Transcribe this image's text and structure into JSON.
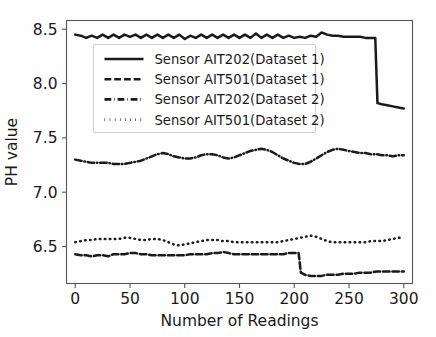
{
  "chart_data": {
    "type": "line",
    "title": "",
    "xlabel": "Number of Readings",
    "ylabel": "PH value",
    "xlim": [
      -8,
      308
    ],
    "ylim": [
      6.16,
      8.58
    ],
    "xticks": [
      0,
      50,
      100,
      150,
      200,
      250,
      300
    ],
    "xticklabels": [
      "0",
      "50",
      "100",
      "150",
      "200",
      "250",
      "300"
    ],
    "yticks": [
      6.5,
      7.0,
      7.5,
      8.0,
      8.5
    ],
    "yticklabels": [
      "6.5",
      "7.0",
      "7.5",
      "8.0",
      "8.5"
    ],
    "grid": false,
    "legend_position": "upper left",
    "line_color": "#1a1a1a",
    "series": [
      {
        "name": "Sensor AIT202(Dataset 1)",
        "style": "solid",
        "x": [
          0,
          5,
          10,
          15,
          20,
          25,
          30,
          35,
          40,
          45,
          50,
          55,
          60,
          65,
          70,
          75,
          80,
          85,
          90,
          95,
          100,
          105,
          110,
          115,
          120,
          125,
          130,
          135,
          140,
          145,
          150,
          155,
          160,
          165,
          170,
          175,
          180,
          185,
          190,
          195,
          200,
          205,
          210,
          215,
          220,
          225,
          230,
          235,
          240,
          245,
          250,
          255,
          260,
          265,
          270,
          274,
          276,
          280,
          285,
          290,
          295,
          300
        ],
        "y": [
          8.45,
          8.44,
          8.42,
          8.44,
          8.42,
          8.45,
          8.42,
          8.45,
          8.42,
          8.45,
          8.43,
          8.45,
          8.42,
          8.45,
          8.42,
          8.45,
          8.42,
          8.45,
          8.42,
          8.45,
          8.41,
          8.44,
          8.42,
          8.45,
          8.42,
          8.45,
          8.42,
          8.45,
          8.42,
          8.45,
          8.42,
          8.45,
          8.42,
          8.46,
          8.42,
          8.45,
          8.42,
          8.45,
          8.42,
          8.44,
          8.42,
          8.43,
          8.42,
          8.44,
          8.43,
          8.47,
          8.45,
          8.44,
          8.44,
          8.43,
          8.43,
          8.43,
          8.43,
          8.42,
          8.42,
          8.42,
          7.82,
          7.81,
          7.8,
          7.79,
          7.78,
          7.77
        ]
      },
      {
        "name": "Sensor AIT501(Dataset 1)",
        "style": "dashed",
        "x": [
          0,
          5,
          10,
          15,
          20,
          25,
          30,
          35,
          40,
          45,
          50,
          55,
          60,
          65,
          70,
          75,
          80,
          85,
          90,
          95,
          100,
          105,
          110,
          115,
          120,
          125,
          130,
          135,
          140,
          145,
          150,
          155,
          160,
          165,
          170,
          175,
          180,
          185,
          190,
          195,
          200,
          204,
          206,
          210,
          215,
          220,
          225,
          230,
          235,
          240,
          245,
          250,
          255,
          260,
          265,
          270,
          275,
          280,
          285,
          290,
          295,
          300
        ],
        "y": [
          6.43,
          6.42,
          6.42,
          6.41,
          6.42,
          6.42,
          6.41,
          6.43,
          6.43,
          6.43,
          6.44,
          6.44,
          6.43,
          6.43,
          6.42,
          6.42,
          6.42,
          6.42,
          6.42,
          6.42,
          6.42,
          6.43,
          6.43,
          6.43,
          6.43,
          6.44,
          6.44,
          6.45,
          6.44,
          6.43,
          6.43,
          6.43,
          6.43,
          6.43,
          6.43,
          6.43,
          6.43,
          6.43,
          6.43,
          6.44,
          6.44,
          6.44,
          6.26,
          6.24,
          6.23,
          6.23,
          6.23,
          6.24,
          6.24,
          6.24,
          6.25,
          6.25,
          6.25,
          6.26,
          6.26,
          6.26,
          6.27,
          6.27,
          6.27,
          6.27,
          6.27,
          6.27
        ]
      },
      {
        "name": "Sensor AIT202(Dataset 2)",
        "style": "dashdot",
        "x": [
          0,
          5,
          10,
          15,
          20,
          25,
          30,
          35,
          40,
          45,
          50,
          55,
          60,
          65,
          70,
          75,
          80,
          85,
          90,
          95,
          100,
          105,
          110,
          115,
          120,
          125,
          130,
          135,
          140,
          145,
          150,
          155,
          160,
          165,
          170,
          175,
          180,
          185,
          190,
          195,
          200,
          205,
          210,
          215,
          220,
          225,
          230,
          235,
          240,
          245,
          250,
          255,
          260,
          265,
          270,
          275,
          280,
          285,
          290,
          295,
          300
        ],
        "y": [
          7.3,
          7.29,
          7.28,
          7.27,
          7.27,
          7.27,
          7.27,
          7.26,
          7.26,
          7.26,
          7.27,
          7.28,
          7.29,
          7.31,
          7.33,
          7.35,
          7.36,
          7.35,
          7.33,
          7.32,
          7.31,
          7.31,
          7.32,
          7.34,
          7.35,
          7.35,
          7.34,
          7.32,
          7.31,
          7.32,
          7.34,
          7.36,
          7.38,
          7.39,
          7.4,
          7.39,
          7.37,
          7.34,
          7.31,
          7.29,
          7.27,
          7.26,
          7.26,
          7.28,
          7.31,
          7.34,
          7.37,
          7.39,
          7.4,
          7.39,
          7.38,
          7.37,
          7.36,
          7.36,
          7.35,
          7.35,
          7.34,
          7.34,
          7.33,
          7.34,
          7.34
        ]
      },
      {
        "name": "Sensor AIT501(Dataset 2)",
        "style": "dotted",
        "x": [
          0,
          5,
          10,
          15,
          20,
          25,
          30,
          35,
          40,
          45,
          50,
          55,
          60,
          65,
          70,
          75,
          80,
          85,
          90,
          95,
          100,
          105,
          110,
          115,
          120,
          125,
          130,
          135,
          140,
          145,
          150,
          155,
          160,
          165,
          170,
          175,
          180,
          185,
          190,
          195,
          200,
          205,
          210,
          215,
          220,
          225,
          230,
          235,
          240,
          245,
          250,
          255,
          260,
          265,
          270,
          275,
          280,
          285,
          290,
          295,
          300
        ],
        "y": [
          6.54,
          6.55,
          6.56,
          6.56,
          6.57,
          6.57,
          6.57,
          6.57,
          6.57,
          6.58,
          6.58,
          6.57,
          6.56,
          6.56,
          6.57,
          6.57,
          6.56,
          6.54,
          6.52,
          6.51,
          6.52,
          6.53,
          6.54,
          6.55,
          6.56,
          6.56,
          6.56,
          6.55,
          6.55,
          6.54,
          6.54,
          6.54,
          6.54,
          6.54,
          6.54,
          6.54,
          6.54,
          6.54,
          6.55,
          6.56,
          6.57,
          6.58,
          6.59,
          6.6,
          6.59,
          6.57,
          6.55,
          6.54,
          6.54,
          6.54,
          6.54,
          6.54,
          6.54,
          6.54,
          6.55,
          6.55,
          6.55,
          6.56,
          6.57,
          6.58,
          6.58
        ]
      }
    ]
  },
  "legend": {
    "entries": [
      {
        "label": "Sensor AIT202(Dataset 1)",
        "style": "solid"
      },
      {
        "label": "Sensor AIT501(Dataset 1)",
        "style": "dashed"
      },
      {
        "label": "Sensor AIT202(Dataset 2)",
        "style": "dashdot"
      },
      {
        "label": "Sensor AIT501(Dataset 2)",
        "style": "dotted"
      }
    ]
  }
}
